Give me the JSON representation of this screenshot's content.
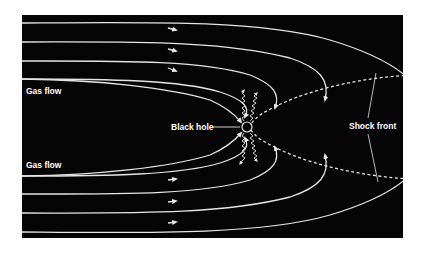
{
  "labels": {
    "gas_flow_top": "Gas flow",
    "gas_flow_bottom": "Gas flow",
    "black_hole": "Black hole",
    "shock_front": "Shock front"
  },
  "colors": {
    "background": "#050505",
    "line": "#e6e6e6",
    "page": "#ffffff"
  },
  "elements": {
    "streamline_count_per_side": 4,
    "radiation_wave_count": 4,
    "shock_front_style": "dashed"
  }
}
